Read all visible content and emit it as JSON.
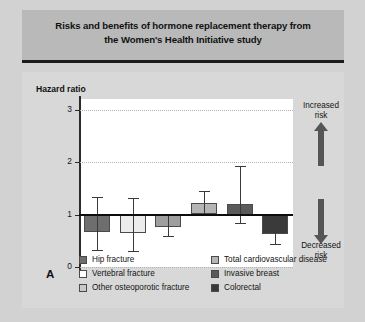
{
  "figure": {
    "title_line1": "Risks and benefits of hormone replacement therapy from",
    "title_line2": "the Women's Health Initiative study",
    "panel_letter": "A",
    "ylabel": "Hazard ratio",
    "annotation_increased": "Increased\nrisk",
    "annotation_increased_line1": "Increased",
    "annotation_increased_line2": "risk",
    "annotation_decreased_line1": "Decreased",
    "annotation_decreased_line2": "risk",
    "banner_bg": "#b9b9b9",
    "panel_bg": "#d8d8d8",
    "plot_bg": "#ffffff",
    "baseline_color": "#0d0d0d",
    "arrow_color": "#555555"
  },
  "legend": {
    "left_column": [
      {
        "label": "Hip fracture",
        "color": "#6e6e6e"
      },
      {
        "label": "Vertebral fracture",
        "color": "#ffffff"
      },
      {
        "label": "Other osteoporotic fracture",
        "color": "#c9c9c9"
      }
    ],
    "right_column": [
      {
        "label": "Total cardiovascular disease",
        "color": "#b5b5b5"
      },
      {
        "label": "Invasive breast",
        "color": "#5a5a5a"
      },
      {
        "label": "Colorectal",
        "color": "#3a3a3a"
      }
    ]
  },
  "chart_data": {
    "type": "bar",
    "title": "Risks and benefits of hormone replacement therapy from the Women's Health Initiative study",
    "xlabel": "",
    "ylabel": "Hazard ratio",
    "ylim": [
      0,
      3.2
    ],
    "yticks": [
      0,
      1,
      2,
      3
    ],
    "ytick_labels": [
      "0",
      "1",
      "2",
      "3"
    ],
    "grid": true,
    "reference_line": 1,
    "legend_position": "bottom",
    "categories": [
      "Hip fracture",
      "Vertebral fracture",
      "Other osteoporotic fracture",
      "Total cardiovascular disease",
      "Invasive breast",
      "Colorectal"
    ],
    "values": [
      0.66,
      0.64,
      0.77,
      1.22,
      1.2,
      0.63
    ],
    "ci_lower": [
      0.33,
      0.31,
      0.6,
      1.0,
      0.83,
      0.43
    ],
    "ci_upper": [
      1.33,
      1.32,
      1.0,
      1.45,
      1.92,
      0.92
    ],
    "colors": [
      "#6e6e6e",
      "#ececec",
      "#9f9f9f",
      "#b5b5b5",
      "#5a5a5a",
      "#3a3a3a"
    ],
    "annotations": [
      "Increased risk",
      "Decreased risk"
    ]
  }
}
